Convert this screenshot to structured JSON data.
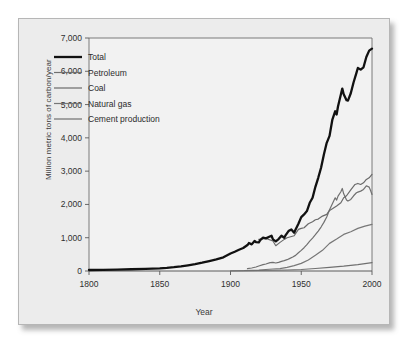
{
  "chart_data": {
    "type": "line",
    "title": "",
    "xlabel": "Year",
    "ylabel": "Million metric tons of carbon/year",
    "xlim": [
      1800,
      2000
    ],
    "ylim": [
      0,
      7000
    ],
    "xticks": [
      1800,
      1850,
      1900,
      1950,
      2000
    ],
    "xticklabels": [
      "1800",
      "1850",
      "1900",
      "1950",
      "2000"
    ],
    "yticks": [
      0,
      1000,
      2000,
      3000,
      4000,
      5000,
      6000,
      7000
    ],
    "yticklabels": [
      "0",
      "1,000",
      "2,000",
      "3,000",
      "4,000",
      "5,000",
      "6,000",
      "7,000"
    ],
    "grid": false,
    "legend_position": "upper left",
    "series": [
      {
        "name": "Total",
        "color": "#111111",
        "width": 2.3,
        "x": [
          1800,
          1810,
          1820,
          1830,
          1840,
          1850,
          1855,
          1860,
          1865,
          1870,
          1875,
          1880,
          1885,
          1890,
          1895,
          1900,
          1903,
          1906,
          1909,
          1912,
          1913,
          1915,
          1917,
          1918,
          1920,
          1921,
          1923,
          1925,
          1927,
          1929,
          1930,
          1932,
          1934,
          1936,
          1938,
          1939,
          1941,
          1943,
          1945,
          1946,
          1948,
          1950,
          1952,
          1954,
          1956,
          1958,
          1960,
          1962,
          1964,
          1966,
          1968,
          1970,
          1972,
          1974,
          1975,
          1976,
          1978,
          1979,
          1980,
          1982,
          1983,
          1985,
          1987,
          1989,
          1990,
          1992,
          1994,
          1996,
          1998,
          1999,
          2000
        ],
        "y": [
          30,
          35,
          42,
          52,
          65,
          80,
          95,
          115,
          140,
          170,
          205,
          250,
          300,
          350,
          410,
          525,
          580,
          640,
          690,
          780,
          840,
          800,
          900,
          870,
          860,
          930,
          1000,
          980,
          1020,
          1060,
          950,
          890,
          960,
          1060,
          1000,
          1080,
          1200,
          1250,
          1150,
          1250,
          1420,
          1620,
          1700,
          1800,
          2050,
          2200,
          2530,
          2800,
          3100,
          3500,
          3850,
          4060,
          4550,
          4800,
          4700,
          4950,
          5300,
          5480,
          5310,
          5130,
          5120,
          5340,
          5670,
          5950,
          6100,
          6050,
          6120,
          6430,
          6620,
          6650,
          6680
        ],
        "endvalue": 6680
      },
      {
        "name": "Petroleum",
        "color": "#707070",
        "width": 1.2,
        "x": [
          1912,
          1915,
          1918,
          1920,
          1923,
          1925,
          1928,
          1930,
          1932,
          1934,
          1936,
          1938,
          1940,
          1942,
          1944,
          1946,
          1948,
          1950,
          1952,
          1954,
          1956,
          1958,
          1960,
          1962,
          1964,
          1966,
          1968,
          1970,
          1972,
          1974,
          1975,
          1976,
          1978,
          1979,
          1980,
          1982,
          1983,
          1985,
          1987,
          1989,
          1990,
          1992,
          1994,
          1996,
          1998,
          1999,
          2000
        ],
        "y": [
          70,
          90,
          120,
          150,
          190,
          210,
          250,
          260,
          240,
          260,
          290,
          310,
          340,
          380,
          420,
          470,
          550,
          620,
          700,
          790,
          900,
          990,
          1090,
          1200,
          1320,
          1460,
          1620,
          1840,
          2020,
          2200,
          2130,
          2250,
          2380,
          2480,
          2320,
          2130,
          2100,
          2150,
          2260,
          2350,
          2370,
          2400,
          2450,
          2560,
          2520,
          2420,
          2300
        ],
        "endvalue": 2300
      },
      {
        "name": "Coal",
        "color": "#6a6a6a",
        "width": 1.2,
        "x": [
          1920,
          1925,
          1930,
          1932,
          1935,
          1938,
          1940,
          1945,
          1948,
          1950,
          1952,
          1955,
          1958,
          1960,
          1962,
          1965,
          1968,
          1970,
          1972,
          1975,
          1978,
          1980,
          1982,
          1985,
          1988,
          1990,
          1992,
          1994,
          1996,
          1998,
          2000
        ],
        "y": [
          950,
          980,
          900,
          760,
          860,
          950,
          1000,
          1060,
          1250,
          1280,
          1300,
          1420,
          1480,
          1540,
          1560,
          1650,
          1700,
          1820,
          1870,
          1950,
          2050,
          2200,
          2260,
          2440,
          2600,
          2630,
          2600,
          2650,
          2750,
          2800,
          2900
        ],
        "endvalue": 2900
      },
      {
        "name": "Natural gas",
        "color": "#777777",
        "width": 1.2,
        "x": [
          1910,
          1920,
          1930,
          1935,
          1940,
          1945,
          1950,
          1955,
          1960,
          1965,
          1970,
          1975,
          1980,
          1985,
          1990,
          1995,
          2000
        ],
        "y": [
          15,
          30,
          60,
          70,
          110,
          160,
          230,
          330,
          470,
          620,
          830,
          960,
          1100,
          1180,
          1280,
          1350,
          1400
        ],
        "endvalue": 1400
      },
      {
        "name": "Cement production",
        "color": "#707070",
        "width": 1.2,
        "x": [
          1900,
          1920,
          1940,
          1950,
          1960,
          1970,
          1980,
          1990,
          2000
        ],
        "y": [
          5,
          15,
          30,
          45,
          75,
          110,
          145,
          190,
          250
        ],
        "endvalue": 250
      }
    ]
  },
  "legend": {
    "items": [
      {
        "label": "Total"
      },
      {
        "label": "Petroleum"
      },
      {
        "label": "Coal"
      },
      {
        "label": "Natural gas"
      },
      {
        "label": "Cement production"
      }
    ]
  }
}
